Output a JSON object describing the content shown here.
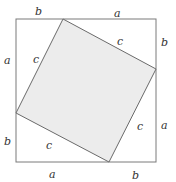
{
  "diagram": {
    "title": "",
    "colors": {
      "background": "#ffffff",
      "outer_stroke": "#7a7a7a",
      "inner_stroke": "#6a6a6a",
      "inner_fill": "#ececec",
      "label": "#333333"
    },
    "outer_square": {
      "x": 16,
      "y": 19,
      "width": 140,
      "height": 143
    },
    "inner_square": {
      "points": "63,19 156,69 109,162 16,113"
    },
    "labels": {
      "top_left": "b",
      "top_right": "a",
      "right_top": "b",
      "right_bottom": "a",
      "bottom_right": "b",
      "bottom_left": "a",
      "left_bottom": "b",
      "left_top": "a",
      "hyp_top": "c",
      "hyp_right": "c",
      "hyp_bottom": "c",
      "hyp_left": "c"
    }
  }
}
